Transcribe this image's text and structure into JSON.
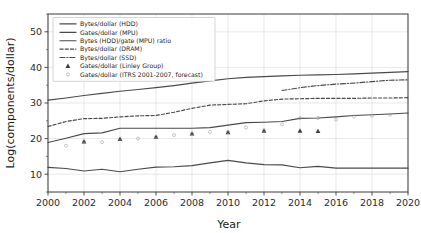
{
  "chart_data": {
    "type": "line",
    "title": "",
    "xlabel": "Year",
    "ylabel": "Log(components/dollar)",
    "xlim": [
      2000,
      2020
    ],
    "ylim": [
      5,
      55
    ],
    "xticks": [
      2000,
      2002,
      2004,
      2006,
      2008,
      2010,
      2012,
      2014,
      2016,
      2018,
      2020
    ],
    "yticks": [
      10,
      20,
      30,
      40,
      50
    ],
    "grid": true,
    "legend_position": "upper left",
    "series": [
      {
        "name": "Bytes/dollar (HDD)",
        "style": "solid",
        "x": [
          2000,
          2001,
          2002,
          2003,
          2004,
          2005,
          2006,
          2007,
          2008,
          2009,
          2010,
          2011,
          2012,
          2013,
          2014,
          2015,
          2016,
          2017,
          2018,
          2019,
          2020
        ],
        "values": [
          30.8,
          31.4,
          32.1,
          32.7,
          33.3,
          33.8,
          34.3,
          34.9,
          35.6,
          36.2,
          36.8,
          37.2,
          37.4,
          37.6,
          37.8,
          37.9,
          38.0,
          38.2,
          38.4,
          38.6,
          38.8
        ]
      },
      {
        "name": "Gates/dollar (MPU)",
        "style": "solid",
        "x": [
          2000,
          2001,
          2002,
          2003,
          2004,
          2005,
          2006,
          2007,
          2008,
          2009,
          2010,
          2011,
          2012,
          2013,
          2014,
          2015,
          2016,
          2017,
          2018,
          2019,
          2020
        ],
        "values": [
          18.9,
          20.1,
          21.4,
          21.6,
          22.9,
          22.9,
          22.9,
          22.9,
          22.9,
          23.1,
          23.8,
          24.5,
          24.6,
          24.8,
          25.7,
          25.8,
          26.1,
          26.5,
          26.7,
          26.9,
          27.2
        ]
      },
      {
        "name": "Bytes (HDD)/gate (MPU) ratio",
        "style": "solid",
        "x": [
          2000,
          2001,
          2002,
          2003,
          2004,
          2005,
          2006,
          2007,
          2008,
          2009,
          2010,
          2011,
          2012,
          2013,
          2014,
          2015,
          2016,
          2017,
          2018,
          2019,
          2020
        ],
        "values": [
          11.9,
          11.6,
          10.9,
          11.4,
          10.7,
          11.4,
          12.0,
          12.1,
          12.4,
          13.2,
          13.9,
          13.2,
          12.7,
          12.6,
          11.8,
          12.2,
          11.7,
          11.7,
          11.7,
          11.7,
          11.7
        ]
      },
      {
        "name": "Bytes/dollar (DRAM)",
        "style": "dashed",
        "x": [
          2000,
          2001,
          2002,
          2003,
          2004,
          2005,
          2006,
          2007,
          2008,
          2009,
          2010,
          2011,
          2012,
          2013,
          2014,
          2015,
          2016,
          2017,
          2018,
          2019,
          2020
        ],
        "values": [
          23.4,
          24.8,
          25.6,
          25.7,
          26.1,
          26.4,
          26.5,
          27.4,
          28.5,
          29.4,
          29.6,
          29.8,
          30.6,
          31.1,
          31.2,
          31.3,
          31.3,
          31.3,
          31.4,
          31.4,
          31.5
        ]
      },
      {
        "name": "Bytes/dollar (SSD)",
        "style": "dashdot",
        "x": [
          2013,
          2014,
          2015,
          2016,
          2017,
          2018,
          2019,
          2020
        ],
        "values": [
          33.5,
          34.3,
          34.9,
          35.3,
          35.6,
          36.0,
          36.4,
          36.5
        ]
      }
    ],
    "scatter_series": [
      {
        "name": "Gates/dollar (Linley Group)",
        "marker": "triangle",
        "x": [
          2002,
          2004,
          2006,
          2008,
          2010,
          2012,
          2014,
          2015
        ],
        "values": [
          19.2,
          19.9,
          20.5,
          21.4,
          21.8,
          22.2,
          22.2,
          22.1
        ]
      },
      {
        "name": "Gates/dollar (ITRS 2001-2007, forecast)",
        "marker": "circle",
        "x": [
          2001,
          2002,
          2003,
          2004,
          2005,
          2006,
          2007,
          2008,
          2009,
          2010,
          2011,
          2012,
          2013,
          2014,
          2015,
          2016,
          2017,
          2018,
          2019
        ],
        "values": [
          18.0,
          19.2,
          19.0,
          19.9,
          20.0,
          20.5,
          21.0,
          21.4,
          21.9,
          21.8,
          23.1,
          22.3,
          24.0,
          25.8,
          25.8,
          25.3,
          26.2,
          26.4,
          26.7
        ]
      }
    ]
  },
  "legend": {
    "items": [
      {
        "label": "Bytes/dollar (HDD)",
        "style": "solid"
      },
      {
        "label": "Gates/dollar (MPU)",
        "style": "solid"
      },
      {
        "label": "Bytes (HDD)/gate (MPU) ratio",
        "style": "solid"
      },
      {
        "label": "Bytes/dollar (DRAM)",
        "style": "dashed"
      },
      {
        "label": "Bytes/dollar (SSD)",
        "style": "dashdot"
      },
      {
        "label": "Gates/dollar (Linley Group)",
        "style": "triangle"
      },
      {
        "label": "Gates/dollar (ITRS 2001-2007, forecast)",
        "style": "circle"
      }
    ]
  },
  "colors": {
    "line": "#4a4a4a",
    "grid": "#d9d9d9",
    "axis": "#3a3a3a",
    "text": "#1a1a1a",
    "marker_tri": "#3c3c3c",
    "marker_dot": "#9a9a9a"
  }
}
